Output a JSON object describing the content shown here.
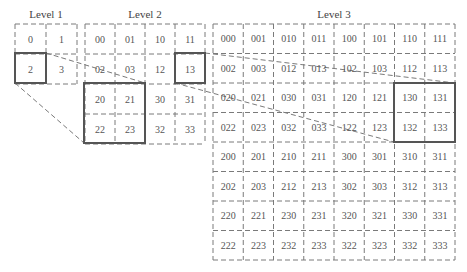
{
  "levels": [
    {
      "title": "Level 1",
      "cols": 2,
      "cells": [
        "0",
        "1",
        "2",
        "3"
      ],
      "highlight": [
        "2"
      ]
    },
    {
      "title": "Level 2",
      "cols": 4,
      "cells": [
        "00",
        "01",
        "10",
        "11",
        "02",
        "03",
        "12",
        "13",
        "20",
        "21",
        "30",
        "31",
        "22",
        "23",
        "32",
        "33"
      ],
      "highlight": [
        "13"
      ],
      "zoom_region": [
        "20",
        "21",
        "22",
        "23"
      ]
    },
    {
      "title": "Level 3",
      "cols": 8,
      "cells": [
        "000",
        "001",
        "010",
        "011",
        "100",
        "101",
        "110",
        "111",
        "002",
        "003",
        "012",
        "013",
        "102",
        "103",
        "112",
        "113",
        "020",
        "021",
        "030",
        "031",
        "120",
        "121",
        "130",
        "131",
        "022",
        "023",
        "032",
        "033",
        "122",
        "123",
        "132",
        "133",
        "200",
        "201",
        "210",
        "211",
        "300",
        "301",
        "310",
        "311",
        "202",
        "203",
        "212",
        "213",
        "302",
        "303",
        "312",
        "313",
        "220",
        "221",
        "230",
        "231",
        "320",
        "321",
        "330",
        "331",
        "222",
        "223",
        "232",
        "233",
        "322",
        "323",
        "332",
        "333"
      ],
      "zoom_region": [
        "130",
        "131",
        "132",
        "133"
      ]
    }
  ],
  "colors": {
    "dash": "#7a7a7a",
    "solid": "#555555",
    "text": "#555555"
  }
}
